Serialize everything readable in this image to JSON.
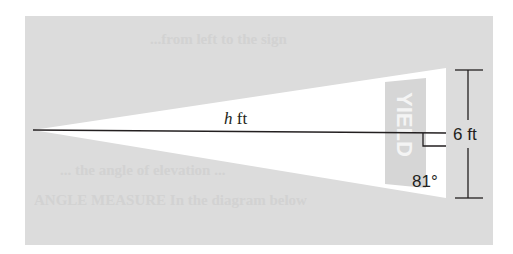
{
  "figure": {
    "colors": {
      "background_panel": "#dcdcdc",
      "triangle_fill": "#ffffff",
      "line": "#231f20",
      "sign_panel": "#d4d4d4",
      "sign_text": "#f4f4f4"
    },
    "labels": {
      "height_var": "h",
      "height_unit": " ft",
      "side_length": "6 ft",
      "angle": "81°"
    },
    "sign": {
      "text": "YIELD"
    },
    "ghost_lines": [
      "...from left to the sign",
      "... the angle of elevation ...",
      "ANGLE MEASURE In the diagram below"
    ]
  }
}
